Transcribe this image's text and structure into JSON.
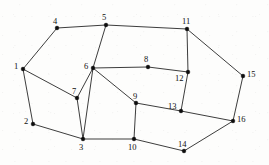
{
  "diagram": {
    "type": "undirected-planar-graph",
    "canvas": {
      "width": 269,
      "height": 165
    },
    "style": {
      "background_color": "#fdfdfc",
      "edge_color": "#1a1a1a",
      "vertex_color": "#0d0d0d",
      "label_color": "#101010",
      "edge_width": 0.85,
      "vertex_radius": 1.9,
      "label_font_size": 8.5
    },
    "counts": {
      "vertices": 16,
      "edges": 23
    },
    "vertices": [
      {
        "id": 1,
        "label": "1",
        "x": 23,
        "y": 69,
        "label_x": 14,
        "label_y": 62,
        "label_pos": "left"
      },
      {
        "id": 2,
        "label": "2",
        "x": 33,
        "y": 124,
        "label_x": 24,
        "label_y": 117,
        "label_pos": "left"
      },
      {
        "id": 3,
        "label": "3",
        "x": 83,
        "y": 139,
        "label_x": 79,
        "label_y": 143,
        "label_pos": "below"
      },
      {
        "id": 4,
        "label": "4",
        "x": 57,
        "y": 28,
        "label_x": 53,
        "label_y": 17,
        "label_pos": "above"
      },
      {
        "id": 5,
        "label": "5",
        "x": 106,
        "y": 25,
        "label_x": 102,
        "label_y": 13,
        "label_pos": "above"
      },
      {
        "id": 6,
        "label": "6",
        "x": 93,
        "y": 68,
        "label_x": 84,
        "label_y": 62,
        "label_pos": "left"
      },
      {
        "id": 7,
        "label": "7",
        "x": 77,
        "y": 98,
        "label_x": 72,
        "label_y": 87,
        "label_pos": "above-left"
      },
      {
        "id": 8,
        "label": "8",
        "x": 148,
        "y": 67,
        "label_x": 144,
        "label_y": 55,
        "label_pos": "above"
      },
      {
        "id": 9,
        "label": "9",
        "x": 136,
        "y": 103,
        "label_x": 133,
        "label_y": 92,
        "label_pos": "above"
      },
      {
        "id": 10,
        "label": "10",
        "x": 134,
        "y": 139,
        "label_x": 128,
        "label_y": 143,
        "label_pos": "below"
      },
      {
        "id": 11,
        "label": "11",
        "x": 187,
        "y": 29,
        "label_x": 182,
        "label_y": 17,
        "label_pos": "above"
      },
      {
        "id": 12,
        "label": "12",
        "x": 188,
        "y": 72,
        "label_x": 175,
        "label_y": 74,
        "label_pos": "left"
      },
      {
        "id": 13,
        "label": "13",
        "x": 181,
        "y": 111,
        "label_x": 168,
        "label_y": 102,
        "label_pos": "above-left"
      },
      {
        "id": 14,
        "label": "14",
        "x": 184,
        "y": 151,
        "label_x": 178,
        "label_y": 140,
        "label_pos": "above"
      },
      {
        "id": 15,
        "label": "15",
        "x": 243,
        "y": 76,
        "label_x": 247,
        "label_y": 70,
        "label_pos": "right"
      },
      {
        "id": 16,
        "label": "16",
        "x": 233,
        "y": 121,
        "label_x": 237,
        "label_y": 115,
        "label_pos": "right"
      }
    ],
    "edges": [
      {
        "from": 1,
        "to": 4
      },
      {
        "from": 1,
        "to": 7
      },
      {
        "from": 1,
        "to": 2
      },
      {
        "from": 2,
        "to": 3
      },
      {
        "from": 3,
        "to": 7
      },
      {
        "from": 3,
        "to": 6
      },
      {
        "from": 3,
        "to": 10
      },
      {
        "from": 4,
        "to": 5
      },
      {
        "from": 5,
        "to": 6
      },
      {
        "from": 5,
        "to": 11
      },
      {
        "from": 6,
        "to": 7
      },
      {
        "from": 6,
        "to": 8
      },
      {
        "from": 6,
        "to": 9
      },
      {
        "from": 8,
        "to": 12
      },
      {
        "from": 9,
        "to": 10
      },
      {
        "from": 9,
        "to": 13
      },
      {
        "from": 10,
        "to": 14
      },
      {
        "from": 11,
        "to": 12
      },
      {
        "from": 11,
        "to": 15
      },
      {
        "from": 12,
        "to": 13
      },
      {
        "from": 13,
        "to": 16
      },
      {
        "from": 14,
        "to": 16
      },
      {
        "from": 15,
        "to": 16
      }
    ]
  }
}
